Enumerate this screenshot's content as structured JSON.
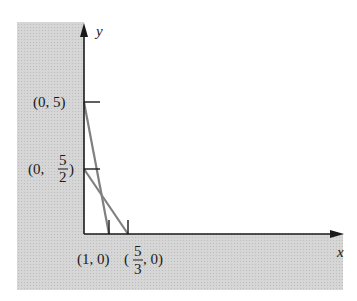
{
  "axes": {
    "x_label": "x",
    "y_label": "y"
  },
  "points": {
    "p05": {
      "label_pre": "(0, 5)"
    },
    "p0_52": {
      "label_pre": "(0, ",
      "num": "5",
      "den": "2",
      "label_post": ")"
    },
    "p10": {
      "label_pre": "(1, 0)"
    },
    "p53_0": {
      "label_pre": "(",
      "num": "5",
      "den": "3",
      "label_post": ", 0)"
    }
  },
  "colors": {
    "shade": "#d4d4d4",
    "axis": "#1a1a1a",
    "line": "#808080"
  },
  "lines": [
    {
      "name": "line-a",
      "from": [
        0,
        5
      ],
      "to": [
        1,
        0
      ]
    },
    {
      "name": "line-b",
      "from": [
        0,
        2.5
      ],
      "to": [
        1.6667,
        0
      ]
    }
  ]
}
